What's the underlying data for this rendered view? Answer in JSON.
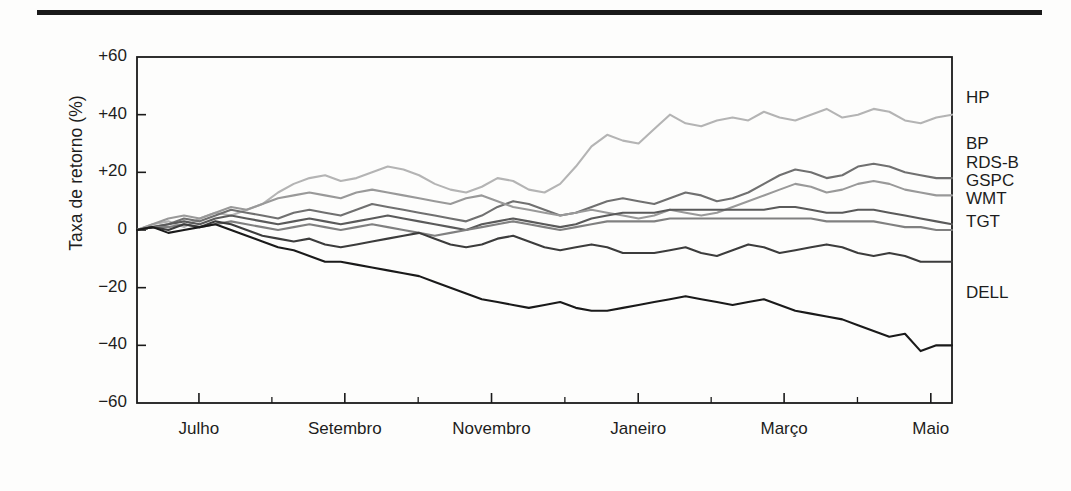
{
  "chart_data": {
    "type": "line",
    "title": "",
    "xlabel": "",
    "ylabel": "Taxa de retorno (%)",
    "ylim": [
      -60,
      60
    ],
    "yticks": [
      60,
      40,
      20,
      0,
      -20,
      -40,
      -60
    ],
    "ytick_labels": [
      "+60",
      "+40",
      "+20",
      "0",
      "−20",
      "−40",
      "−60"
    ],
    "grid": false,
    "legend_position": "right-outside",
    "xtick_labels": [
      "Julho",
      "Setembro",
      "Novembro",
      "Janeiro",
      "Março",
      "Maio"
    ],
    "xtick_positions_frac": [
      0.076,
      0.255,
      0.435,
      0.615,
      0.794,
      0.974
    ],
    "x_start_label": "Junho",
    "x_end_label": "Junho",
    "n_points": 53,
    "series": [
      {
        "name": "HP",
        "color": "#b4b4b4",
        "values": [
          0,
          2,
          3,
          1,
          4,
          6,
          5,
          7,
          9,
          13,
          16,
          18,
          19,
          17,
          18,
          20,
          22,
          21,
          19,
          16,
          14,
          13,
          15,
          18,
          17,
          14,
          13,
          16,
          22,
          29,
          33,
          31,
          30,
          35,
          40,
          37,
          36,
          38,
          39,
          38,
          41,
          39,
          38,
          40,
          42,
          39,
          40,
          42,
          41,
          38,
          37,
          39,
          40
        ]
      },
      {
        "name": "BP",
        "color": "#707070",
        "values": [
          0,
          1,
          2,
          4,
          3,
          5,
          7,
          6,
          5,
          4,
          6,
          7,
          6,
          5,
          7,
          9,
          8,
          7,
          6,
          5,
          4,
          3,
          5,
          8,
          10,
          9,
          7,
          5,
          6,
          8,
          10,
          11,
          10,
          9,
          11,
          13,
          12,
          10,
          11,
          13,
          16,
          19,
          21,
          20,
          18,
          19,
          22,
          23,
          22,
          20,
          19,
          18,
          18
        ]
      },
      {
        "name": "RDS-B",
        "color": "#999999",
        "values": [
          0,
          2,
          4,
          5,
          4,
          6,
          8,
          7,
          9,
          11,
          12,
          13,
          12,
          11,
          13,
          14,
          13,
          12,
          11,
          10,
          9,
          11,
          12,
          10,
          8,
          7,
          6,
          5,
          6,
          7,
          6,
          5,
          4,
          5,
          7,
          6,
          5,
          6,
          8,
          10,
          12,
          14,
          16,
          15,
          13,
          14,
          16,
          17,
          16,
          14,
          13,
          12,
          12
        ]
      },
      {
        "name": "GSPC",
        "color": "#5a5a5a",
        "values": [
          0,
          1,
          2,
          3,
          2,
          4,
          5,
          4,
          3,
          2,
          3,
          4,
          3,
          2,
          3,
          4,
          5,
          4,
          3,
          2,
          1,
          0,
          2,
          3,
          4,
          3,
          2,
          1,
          2,
          4,
          5,
          6,
          6,
          6,
          7,
          7,
          7,
          7,
          7,
          7,
          7,
          8,
          8,
          7,
          6,
          6,
          7,
          7,
          6,
          5,
          4,
          3,
          2
        ]
      },
      {
        "name": "WMT",
        "color": "#808080",
        "values": [
          0,
          1,
          1,
          2,
          1,
          2,
          3,
          2,
          1,
          0,
          1,
          2,
          1,
          0,
          1,
          2,
          1,
          0,
          -1,
          -2,
          -1,
          0,
          1,
          2,
          3,
          2,
          1,
          0,
          1,
          2,
          3,
          3,
          3,
          3,
          4,
          4,
          4,
          4,
          4,
          4,
          4,
          4,
          4,
          4,
          3,
          3,
          3,
          3,
          2,
          1,
          1,
          0,
          0
        ]
      },
      {
        "name": "TGT",
        "color": "#3c3c3c",
        "values": [
          0,
          1,
          0,
          2,
          1,
          3,
          2,
          0,
          -2,
          -3,
          -4,
          -3,
          -5,
          -6,
          -5,
          -4,
          -3,
          -2,
          -1,
          -3,
          -5,
          -6,
          -5,
          -3,
          -2,
          -4,
          -6,
          -7,
          -6,
          -5,
          -6,
          -8,
          -8,
          -8,
          -7,
          -6,
          -8,
          -9,
          -7,
          -5,
          -6,
          -8,
          -7,
          -6,
          -5,
          -6,
          -8,
          -9,
          -8,
          -9,
          -11,
          -11,
          -11
        ]
      },
      {
        "name": "DELL",
        "color": "#1a1a1a",
        "values": [
          0,
          1,
          -1,
          0,
          1,
          2,
          0,
          -2,
          -4,
          -6,
          -7,
          -9,
          -11,
          -11,
          -12,
          -13,
          -14,
          -15,
          -16,
          -18,
          -20,
          -22,
          -24,
          -25,
          -26,
          -27,
          -26,
          -25,
          -27,
          -28,
          -28,
          -27,
          -26,
          -25,
          -24,
          -23,
          -24,
          -25,
          -26,
          -25,
          -24,
          -26,
          -28,
          -29,
          -30,
          -31,
          -33,
          -35,
          -37,
          -36,
          -42,
          -40,
          -40
        ]
      }
    ]
  },
  "legend": {
    "items": [
      {
        "label": "HP",
        "y": 88
      },
      {
        "label": "BP",
        "y": 134
      },
      {
        "label": "RDS-B",
        "y": 153
      },
      {
        "label": "GSPC",
        "y": 171
      },
      {
        "label": "WMT",
        "y": 189
      },
      {
        "label": "TGT",
        "y": 212
      },
      {
        "label": "DELL",
        "y": 283
      }
    ]
  },
  "axis": {
    "plot_left": 137,
    "plot_right": 952,
    "plot_top": 57,
    "plot_bottom": 403
  }
}
